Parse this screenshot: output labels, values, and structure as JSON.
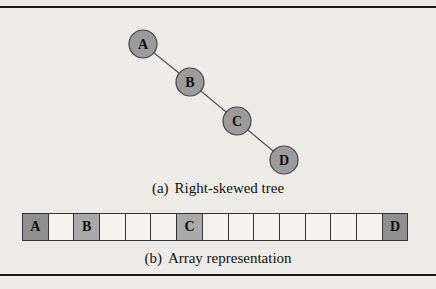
{
  "tree": {
    "nodes": [
      {
        "label": "A",
        "cx": 143,
        "cy": 44
      },
      {
        "label": "B",
        "cx": 190,
        "cy": 82
      },
      {
        "label": "C",
        "cx": 237,
        "cy": 121
      },
      {
        "label": "D",
        "cx": 284,
        "cy": 160
      }
    ],
    "edges": [
      [
        "A",
        "B"
      ],
      [
        "B",
        "C"
      ],
      [
        "C",
        "D"
      ]
    ],
    "node_fill": "#9b9b9b",
    "caption_tag": "(a)",
    "caption": "Right-skewed tree"
  },
  "array": {
    "size": 15,
    "cells": [
      "A",
      "",
      "B",
      "",
      "",
      "",
      "C",
      "",
      "",
      "",
      "",
      "",
      "",
      "",
      "D"
    ],
    "filled_color": "#8f8f8f",
    "caption_tag": "(b)",
    "caption": "Array representation"
  }
}
